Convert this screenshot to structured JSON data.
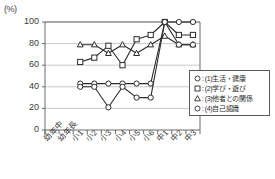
{
  "chart_data": {
    "type": "line",
    "title": "",
    "subtitle": "",
    "xlabel": "",
    "ylabel": "",
    "unit_label": "(%)",
    "ylim": [
      0,
      100
    ],
    "yticks": [
      0,
      20,
      40,
      60,
      80,
      100
    ],
    "grid": true,
    "grid_axis": "y",
    "legend_position": "inside-bottom-right",
    "categories": [
      "幼年中",
      "幼年長",
      "小1",
      "小2",
      "小3",
      "小4",
      "小5",
      "小6",
      "中1",
      "中2",
      "中3"
    ],
    "series": [
      {
        "name": "(1)生活・健康",
        "key": "1",
        "marker": "circle",
        "legend_label": "(1)生活・健康",
        "values": [
          null,
          null,
          43,
          43,
          43,
          43,
          43,
          43,
          100,
          100,
          100
        ]
      },
      {
        "name": "(2)学び・遊び",
        "key": "2",
        "marker": "square",
        "legend_label": "(2)学び・遊び",
        "values": [
          null,
          null,
          63,
          67,
          78,
          60,
          84,
          88,
          100,
          88,
          88
        ]
      },
      {
        "name": "(3)他者との関係",
        "key": "3",
        "marker": "triangle",
        "legend_label": "(3)他者との関係",
        "values": [
          null,
          null,
          79,
          79,
          71,
          79,
          71,
          79,
          87,
          79,
          79
        ]
      },
      {
        "name": "(4)自己認識",
        "key": "4",
        "marker": "circle",
        "legend_label": "(4)自己認識",
        "values": [
          null,
          null,
          40,
          40,
          21,
          40,
          30,
          30,
          100,
          79,
          79
        ]
      }
    ],
    "legend_entries": [
      {
        "marker": "circle",
        "separator": ":",
        "label": "(1)生活・健康"
      },
      {
        "marker": "square",
        "separator": ":",
        "label": "(2)学び・遊び"
      },
      {
        "marker": "triangle",
        "separator": ":",
        "label": "(3)他者との関係"
      },
      {
        "marker": "circle",
        "separator": ":",
        "label": "(4)自己認識"
      }
    ],
    "colors": {
      "line": "#2b2b2b",
      "marker_fill": "#ffffff",
      "marker_stroke": "#2b2b2b",
      "axis": "#6b6b6b",
      "grid": "#c9c9c9",
      "text": "#333333",
      "legend_border": "#5a5a5a",
      "background": "#ffffff"
    }
  }
}
